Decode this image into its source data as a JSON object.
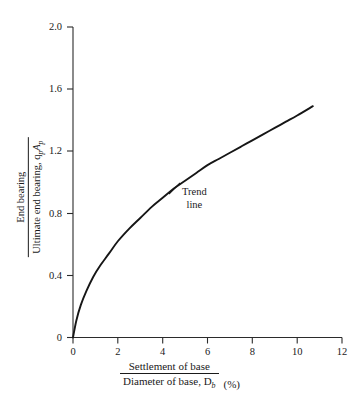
{
  "chart_data": {
    "type": "line",
    "title": "",
    "subtitle": "",
    "xlabel_numerator": "Settlement of base",
    "xlabel_denominator": "Diameter of base, D",
    "xlabel_denominator_sub": "b",
    "xlabel_units": "(%)",
    "ylabel_numerator": "End bearing",
    "ylabel_denominator": "Ultimate end bearing, q",
    "ylabel_denominator_sub1": "p",
    "ylabel_denominator_mid": "A",
    "ylabel_denominator_sub2": "p",
    "xlim": [
      0,
      12
    ],
    "ylim": [
      0,
      2.0
    ],
    "xticks": [
      "0",
      "2",
      "4",
      "6",
      "8",
      "10",
      "12"
    ],
    "xtick_values": [
      0,
      2,
      4,
      6,
      8,
      10,
      12
    ],
    "yticks": [
      "0",
      "0.4",
      "0.8",
      "1.2",
      "1.6",
      "2.0"
    ],
    "ytick_values": [
      0,
      0.4,
      0.8,
      1.2,
      1.6,
      2.0
    ],
    "grid": false,
    "legend": "none",
    "series": [
      {
        "name": "Trend line",
        "color": "#161616",
        "x": [
          0.0,
          0.15,
          0.35,
          0.6,
          0.9,
          1.2,
          1.6,
          2.0,
          2.5,
          3.0,
          3.5,
          4.0,
          4.5,
          5.0,
          5.5,
          6.0,
          6.5,
          7.0,
          7.5,
          8.0,
          8.5,
          9.0,
          9.5,
          10.0,
          10.7
        ],
        "y": [
          0.0,
          0.11,
          0.21,
          0.3,
          0.39,
          0.46,
          0.54,
          0.62,
          0.7,
          0.77,
          0.84,
          0.9,
          0.96,
          1.01,
          1.06,
          1.11,
          1.15,
          1.19,
          1.23,
          1.27,
          1.31,
          1.35,
          1.39,
          1.43,
          1.49
        ]
      }
    ],
    "annotations": [
      {
        "name": "trend-line-callout",
        "line1": "Trend",
        "line2": "line",
        "x": 5.0,
        "y": 0.95
      }
    ]
  }
}
